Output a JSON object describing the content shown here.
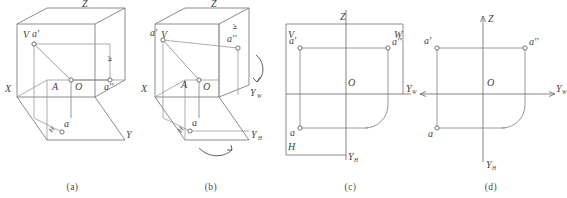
{
  "figure": {
    "panels": [
      {
        "id": "a",
        "caption": "(a)",
        "description": "Three mutually perpendicular projection planes with point A and its three projections",
        "labels": {
          "z_axis": "Z",
          "x_axis": "X",
          "y_axis": "Y",
          "v_plane": "V",
          "h_plane": "H",
          "w_plane": "W",
          "origin": "O",
          "point_space": "A",
          "proj_front": "a'",
          "proj_top": "a",
          "proj_side": "a''"
        }
      },
      {
        "id": "b",
        "caption": "(b)",
        "description": "Unfolding the H plane downward and the W plane rightward about the X and Z axes",
        "labels": {
          "z_axis": "Z",
          "x_axis": "X",
          "y_h_axis": "Y",
          "y_h_sub": "H",
          "y_w_axis": "Y",
          "y_w_sub": "W",
          "v_plane": "V",
          "h_plane": "H",
          "w_plane": "W",
          "origin": "O",
          "point_space": "A",
          "proj_front": "a'",
          "proj_top": "a",
          "proj_side": "a''"
        }
      },
      {
        "id": "c",
        "caption": "(c)",
        "description": "The three planes rotated into one flat sheet, projection lines and the 45 degree quarter arc shown",
        "labels": {
          "z_axis": "Z",
          "x_axis": "X",
          "y_w_axis": "Y",
          "y_w_sub": "W",
          "y_h_axis": "Y",
          "y_h_sub": "H",
          "v_plane": "V",
          "h_plane": "H",
          "w_plane": "W",
          "origin": "O",
          "proj_front": "a'",
          "proj_top": "a",
          "proj_side": "a''"
        }
      },
      {
        "id": "d",
        "caption": "(d)",
        "description": "Final three-view layout with plane borders removed, only axes and projections remain",
        "labels": {
          "z_axis": "Z",
          "x_axis": "X",
          "y_w_axis": "Y",
          "y_w_sub": "W",
          "y_h_axis": "Y",
          "y_h_sub": "H",
          "origin": "O",
          "proj_front": "a'",
          "proj_top": "a",
          "proj_side": "a''"
        }
      }
    ]
  }
}
